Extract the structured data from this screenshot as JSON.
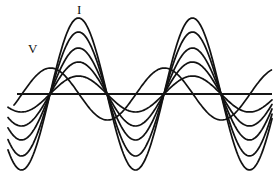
{
  "figure": {
    "kind": "waveform-plot",
    "background_color": "#ffffff",
    "stroke_color": "#121212",
    "width": 275,
    "height": 186,
    "labels": {
      "current_label": "I",
      "voltage_label": "V"
    }
  },
  "chart_data": {
    "type": "line",
    "title": "",
    "subtitle": "",
    "xlabel": "",
    "ylabel": "",
    "grid": false,
    "legend_position": "inline-annotation",
    "annotations": [
      {
        "text": "I",
        "x": 80,
        "y": 10,
        "describes": "current-waveform-family"
      },
      {
        "text": "V",
        "x": 32,
        "y": 48,
        "describes": "voltage-waveform"
      }
    ],
    "axis": {
      "zero_line_y": 94,
      "x_start": 17,
      "x_end": 272,
      "visible": true,
      "ticks": [],
      "tick_labels": []
    },
    "zero_crossings_x": [
      50,
      108,
      178,
      262
    ],
    "period_px": 114,
    "series": [
      {
        "name": "V",
        "role": "voltage",
        "amplitude_px": 26,
        "phase_lead_px": 28,
        "peaks": [
          {
            "x": 48,
            "y": 68
          },
          {
            "x": 212,
            "y": 68
          }
        ],
        "troughs": [
          {
            "x": 130,
            "y": 120
          }
        ],
        "zero_crossings_x": [
          22,
          82,
          185,
          268
        ]
      },
      {
        "name": "I1",
        "role": "current",
        "amplitude_px": 18,
        "peaks": [
          {
            "x": 80,
            "y": 76
          },
          {
            "x": 236,
            "y": 76
          }
        ],
        "troughs": [
          {
            "x": 143,
            "y": 112
          }
        ]
      },
      {
        "name": "I2",
        "role": "current",
        "amplitude_px": 32,
        "peaks": [
          {
            "x": 80,
            "y": 62
          },
          {
            "x": 236,
            "y": 62
          }
        ],
        "troughs": [
          {
            "x": 143,
            "y": 126
          }
        ]
      },
      {
        "name": "I3",
        "role": "current",
        "amplitude_px": 46,
        "peaks": [
          {
            "x": 80,
            "y": 48
          },
          {
            "x": 236,
            "y": 48
          }
        ],
        "troughs": [
          {
            "x": 143,
            "y": 140
          }
        ]
      },
      {
        "name": "I4",
        "role": "current",
        "amplitude_px": 62,
        "peaks": [
          {
            "x": 80,
            "y": 32
          },
          {
            "x": 236,
            "y": 32
          }
        ],
        "troughs": [
          {
            "x": 143,
            "y": 156
          }
        ]
      },
      {
        "name": "I5",
        "role": "current",
        "amplitude_px": 76,
        "peaks": [
          {
            "x": 80,
            "y": 18
          },
          {
            "x": 236,
            "y": 18
          }
        ],
        "troughs": [
          {
            "x": 143,
            "y": 170
          }
        ]
      }
    ]
  }
}
